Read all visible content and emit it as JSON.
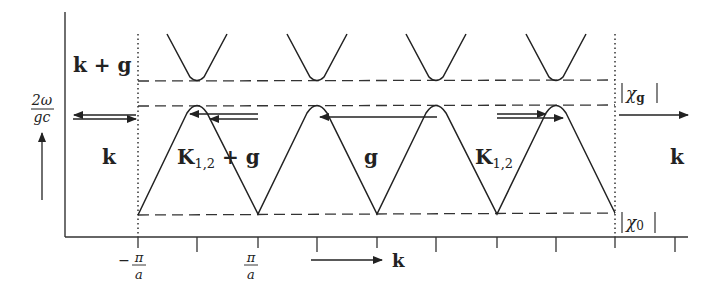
{
  "diagram": {
    "type": "dispersion-relation",
    "y_axis": {
      "label_numerator": "2ω",
      "label_denominator": "gc"
    },
    "x_axis": {
      "arrow_label": "k",
      "tick_labels": [
        {
          "sign": "−",
          "numerator": "π",
          "denominator": "a"
        },
        {
          "sign": "",
          "numerator": "π",
          "denominator": "a"
        }
      ]
    },
    "region_labels": {
      "upper_left": "k + g",
      "left": "k",
      "right": "k",
      "band1": "K",
      "band1_sub": "1,2",
      "band1_suffix": " + g",
      "band2": "g",
      "band3": "K",
      "band3_sub": "1,2"
    },
    "gap_labels": {
      "chi_g": "χ",
      "chi_g_sub": "g",
      "chi_0": "χ",
      "chi_0_sub": "0"
    },
    "colors": {
      "line": "#222222",
      "background": "#ffffff"
    }
  }
}
